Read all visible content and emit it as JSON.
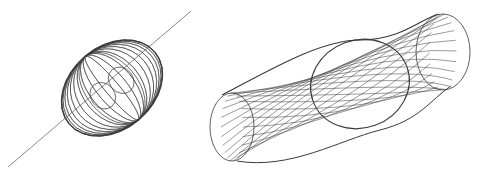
{
  "figure": {
    "background": "#ffffff",
    "stroke_color": "#3a3a3a",
    "axis_color": "#8a8a8a",
    "panels": [
      {
        "name": "toroidal-field-figure",
        "axis_line": {
          "x1": 8,
          "y1": 167,
          "x2": 191,
          "y2": 11
        },
        "center": {
          "x": 112,
          "y": 88
        },
        "body_rx": 56,
        "body_ry": 42,
        "rotation_deg": -40,
        "loop_count": 22
      },
      {
        "name": "twisted-tube-figure",
        "left_end": {
          "cx": 232,
          "cy": 127,
          "rx": 22,
          "ry": 34
        },
        "right_end": {
          "cx": 443,
          "cy": 52,
          "rx": 27,
          "ry": 38
        },
        "throat": {
          "cx": 360,
          "cy": 84,
          "rx": 50,
          "ry": 44
        },
        "line_count": 22
      }
    ]
  }
}
